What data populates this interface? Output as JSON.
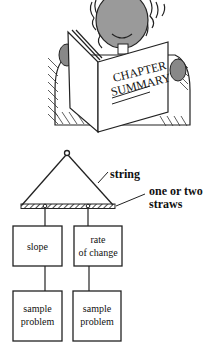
{
  "illustration": {
    "subject": "person reading a book",
    "book_title_line1": "CHAPTER",
    "book_title_line2": "SUMMARY"
  },
  "diagram": {
    "type": "mobile (hanging organizer)",
    "labels": {
      "string": "string",
      "straws_line1": "one or two",
      "straws_line2": "straws"
    },
    "columns": [
      {
        "top_lines": [
          "slope"
        ],
        "bottom_lines": [
          "sample",
          "problem"
        ]
      },
      {
        "top_lines": [
          "rate",
          "of change"
        ],
        "bottom_lines": [
          "sample",
          "problem"
        ]
      }
    ]
  }
}
